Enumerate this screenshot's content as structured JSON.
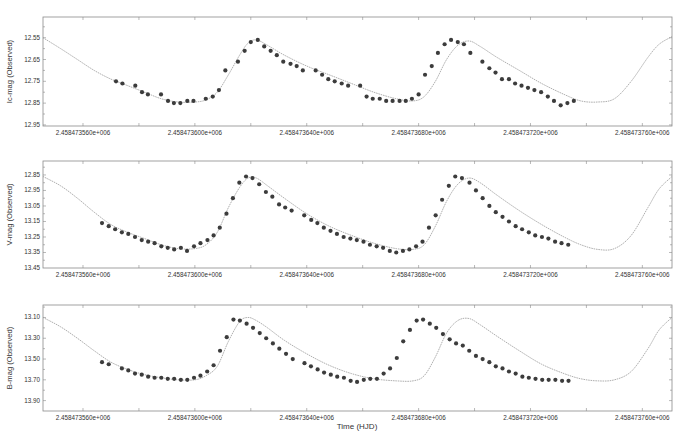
{
  "chart_data": [
    {
      "type": "scatter",
      "panel": "top",
      "ylabel": "Ic-mag (Observed)",
      "xlabel": "",
      "y_inverted": true,
      "yticks": [
        12.55,
        12.65,
        12.75,
        12.85,
        12.95
      ],
      "ytick_labels": [
        "12.55",
        "12.65",
        "12.75",
        "12.85",
        "12.95"
      ],
      "ylim": [
        12.955,
        12.455
      ],
      "xticks": [
        73560,
        73600,
        73640,
        73680,
        73720,
        73760
      ],
      "xtick_labels": [
        "2.458473560e+006",
        "2.458473600e+006",
        "2.458473640e+006",
        "2.458473680e+006",
        "2.458473720e+006",
        "2.458473760e+006"
      ],
      "xlim": [
        73545.7,
        73770.6
      ],
      "x_offset_note": "x values are HJD - 2458400",
      "series": [
        {
          "name": "observed",
          "style": "markers",
          "x": [
            73571.8,
            73574.1,
            73578.7,
            73581.1,
            73583.2,
            73587.9,
            73590.4,
            73592.5,
            73594.8,
            73597.3,
            73599.5,
            73603.9,
            73606.4,
            73608.6,
            73610.9,
            73615.4,
            73617.8,
            73620.0,
            73622.5,
            73624.8,
            73627.1,
            73629.3,
            73631.6,
            73634.2,
            73636.4,
            73638.6,
            73643.2,
            73645.5,
            73647.7,
            73650.0,
            73652.5,
            73654.8,
            73659.1,
            73661.4,
            73663.6,
            73666.1,
            73668.4,
            73670.7,
            73673.2,
            73675.4,
            73677.6,
            73680.0,
            73682.3,
            73684.7,
            73686.9,
            73689.3,
            73691.6,
            73694.0,
            73696.2,
            73698.5,
            73702.8,
            73705.3,
            73707.5,
            73709.8,
            73712.3,
            73714.5,
            73716.8,
            73719.1,
            73721.4,
            73723.8,
            73726.2,
            73728.4,
            73730.8,
            73733.2,
            73735.5
          ],
          "y": [
            12.75,
            12.76,
            12.77,
            12.8,
            12.81,
            12.81,
            12.84,
            12.85,
            12.85,
            12.84,
            12.84,
            12.83,
            12.82,
            12.79,
            12.7,
            12.66,
            12.61,
            12.57,
            12.56,
            12.59,
            12.61,
            12.63,
            12.66,
            12.67,
            12.68,
            12.7,
            12.7,
            12.72,
            12.74,
            12.75,
            12.76,
            12.77,
            12.77,
            12.82,
            12.83,
            12.83,
            12.84,
            12.84,
            12.84,
            12.84,
            12.83,
            12.81,
            12.72,
            12.68,
            12.62,
            12.58,
            12.56,
            12.57,
            12.58,
            12.62,
            12.66,
            12.69,
            12.71,
            12.74,
            12.74,
            12.76,
            12.77,
            12.78,
            12.79,
            12.8,
            12.82,
            12.84,
            12.86,
            12.85,
            12.84
          ]
        },
        {
          "name": "model fit",
          "style": "line",
          "color": "#9a9a9a",
          "x": [
            73545.7,
            73552,
            73558,
            73564,
            73570,
            73576,
            73582,
            73588,
            73594,
            73600,
            73604,
            73608,
            73612,
            73616,
            73619,
            73622,
            73626,
            73632,
            73640,
            73648,
            73656,
            73664,
            73672,
            73678,
            73682,
            73686,
            73690,
            73694,
            73698,
            73702,
            73708,
            73716,
            73724,
            73732,
            73738,
            73744,
            73750,
            73756,
            73762,
            73766,
            73770.6
          ],
          "y": [
            12.55,
            12.6,
            12.65,
            12.7,
            12.74,
            12.77,
            12.8,
            12.83,
            12.845,
            12.845,
            12.835,
            12.8,
            12.72,
            12.63,
            12.575,
            12.56,
            12.585,
            12.63,
            12.68,
            12.72,
            12.76,
            12.8,
            12.83,
            12.84,
            12.82,
            12.75,
            12.65,
            12.585,
            12.565,
            12.59,
            12.64,
            12.7,
            12.76,
            12.81,
            12.84,
            12.845,
            12.83,
            12.75,
            12.64,
            12.58,
            12.545
          ]
        }
      ]
    },
    {
      "type": "scatter",
      "panel": "middle",
      "ylabel": "V-mag (Observed)",
      "xlabel": "",
      "y_inverted": true,
      "yticks": [
        12.85,
        12.95,
        13.05,
        13.15,
        13.25,
        13.35,
        13.45
      ],
      "ytick_labels": [
        "12.85",
        "12.95",
        "13.05",
        "13.15",
        "13.25",
        "13.35",
        "13.45"
      ],
      "ylim": [
        13.45,
        12.76
      ],
      "xticks": [
        73560,
        73600,
        73640,
        73680,
        73720,
        73760
      ],
      "xtick_labels": [
        "2.458473560e+006",
        "2.458473600e+006",
        "2.458473640e+006",
        "2.458473680e+006",
        "2.458473720e+006",
        "2.458473760e+006"
      ],
      "xlim": [
        73545.7,
        73770.6
      ],
      "series": [
        {
          "name": "observed",
          "style": "markers",
          "x": [
            73566.8,
            73569.2,
            73571.5,
            73573.9,
            73576.2,
            73578.6,
            73581.0,
            73583.3,
            73585.6,
            73588.0,
            73590.3,
            73592.6,
            73595.0,
            73597.2,
            73599.7,
            73602.0,
            73604.5,
            73606.7,
            73608.9,
            73611.3,
            73613.6,
            73615.9,
            73618.3,
            73620.6,
            73623.0,
            73625.4,
            73627.7,
            73630.1,
            73632.3,
            73634.6,
            73639.1,
            73641.6,
            73643.8,
            73646.1,
            73648.5,
            73650.8,
            73653.2,
            73655.6,
            73657.9,
            73660.3,
            73662.6,
            73665.0,
            73667.3,
            73669.7,
            73672.0,
            73674.4,
            73676.7,
            73679.1,
            73681.4,
            73683.7,
            73686.1,
            73688.4,
            73690.8,
            73693.1,
            73695.5,
            73698.2,
            73700.5,
            73702.9,
            73705.3,
            73707.6,
            73710.0,
            73712.3,
            73714.7,
            73717.0,
            73719.4,
            73721.7,
            73724.1,
            73726.4,
            73728.8,
            73731.1,
            73733.5
          ],
          "y": [
            13.16,
            13.18,
            13.2,
            13.22,
            13.23,
            13.25,
            13.27,
            13.28,
            13.29,
            13.31,
            13.32,
            13.33,
            13.32,
            13.34,
            13.31,
            13.29,
            13.27,
            13.24,
            13.19,
            13.1,
            13.0,
            12.9,
            12.86,
            12.87,
            12.91,
            12.96,
            12.99,
            13.04,
            13.06,
            13.08,
            13.11,
            13.14,
            13.16,
            13.19,
            13.21,
            13.23,
            13.25,
            13.26,
            13.27,
            13.28,
            13.3,
            13.31,
            13.32,
            13.34,
            13.35,
            13.34,
            13.33,
            13.31,
            13.28,
            13.19,
            13.11,
            13.01,
            12.92,
            12.86,
            12.87,
            12.9,
            12.95,
            13.0,
            13.05,
            13.09,
            13.12,
            13.15,
            13.18,
            13.2,
            13.22,
            13.24,
            13.25,
            13.26,
            13.28,
            13.29,
            13.3
          ]
        },
        {
          "name": "model fit",
          "style": "line",
          "color": "#9a9a9a",
          "x": [
            73545.7,
            73552,
            73558,
            73564,
            73570,
            73576,
            73582,
            73588,
            73594,
            73600,
            73604,
            73608,
            73612,
            73616,
            73619,
            73622,
            73626,
            73632,
            73640,
            73648,
            73656,
            73664,
            73672,
            73678,
            73682,
            73686,
            73690,
            73694,
            73698,
            73702,
            73708,
            73716,
            73724,
            73732,
            73738,
            73744,
            73750,
            73756,
            73762,
            73766,
            73770.6
          ],
          "y": [
            12.86,
            12.92,
            13.0,
            13.09,
            13.17,
            13.22,
            13.26,
            13.3,
            13.325,
            13.325,
            13.3,
            13.22,
            13.06,
            12.93,
            12.87,
            12.87,
            12.92,
            13.0,
            13.1,
            13.18,
            13.24,
            13.29,
            13.325,
            13.33,
            13.3,
            13.18,
            13.02,
            12.91,
            12.87,
            12.9,
            12.98,
            13.08,
            13.17,
            13.25,
            13.3,
            13.33,
            13.325,
            13.24,
            13.06,
            12.94,
            12.86
          ]
        }
      ]
    },
    {
      "type": "scatter",
      "panel": "bottom",
      "ylabel": "B-mag (Observed)",
      "xlabel": "Time (HJD)",
      "y_inverted": true,
      "yticks": [
        13.1,
        13.3,
        13.5,
        13.7,
        13.9
      ],
      "ytick_labels": [
        "13.10",
        "13.30",
        "13.50",
        "13.70",
        "13.90"
      ],
      "ylim": [
        14.0,
        12.98
      ],
      "xticks": [
        73560,
        73600,
        73640,
        73680,
        73720,
        73760
      ],
      "xtick_labels": [
        "2.458473560e+006",
        "2.458473600e+006",
        "2.458473640e+006",
        "2.458473680e+006",
        "2.458473720e+006",
        "2.458473760e+006"
      ],
      "xlim": [
        73545.7,
        73770.6
      ],
      "series": [
        {
          "name": "observed",
          "style": "markers",
          "x": [
            73566.8,
            73569.2,
            73573.9,
            73576.2,
            73578.6,
            73581.0,
            73583.3,
            73585.6,
            73588.0,
            73590.3,
            73592.6,
            73595.0,
            73597.3,
            73599.7,
            73602.0,
            73604.4,
            73606.7,
            73609.0,
            73611.4,
            73613.8,
            73616.1,
            73618.5,
            73620.8,
            73623.2,
            73625.5,
            73627.9,
            73630.2,
            73632.6,
            73635.0,
            73639.2,
            73641.5,
            73643.9,
            73646.2,
            73648.6,
            73650.9,
            73653.3,
            73655.7,
            73658.0,
            73660.4,
            73662.7,
            73665.1,
            73667.5,
            73669.8,
            73672.2,
            73674.5,
            73676.9,
            73679.3,
            73681.6,
            73684.0,
            73686.3,
            73688.7,
            73691.1,
            73693.4,
            73695.8,
            73698.1,
            73700.5,
            73702.9,
            73705.3,
            73707.6,
            73710.0,
            73712.3,
            73714.7,
            73717.1,
            73719.4,
            73721.8,
            73724.2,
            73726.5,
            73728.9,
            73731.3,
            73733.6
          ],
          "y": [
            13.53,
            13.55,
            13.59,
            13.61,
            13.64,
            13.65,
            13.67,
            13.68,
            13.68,
            13.69,
            13.69,
            13.7,
            13.7,
            13.68,
            13.66,
            13.62,
            13.56,
            13.42,
            13.29,
            13.12,
            13.13,
            13.16,
            13.2,
            13.25,
            13.3,
            13.35,
            13.4,
            13.45,
            13.5,
            13.54,
            13.57,
            13.6,
            13.63,
            13.65,
            13.67,
            13.68,
            13.71,
            13.72,
            13.7,
            13.69,
            13.69,
            13.64,
            13.59,
            13.49,
            13.33,
            13.22,
            13.13,
            13.12,
            13.16,
            13.2,
            13.26,
            13.31,
            13.35,
            13.37,
            13.42,
            13.47,
            13.5,
            13.53,
            13.57,
            13.59,
            13.62,
            13.64,
            13.67,
            13.68,
            13.69,
            13.7,
            13.7,
            13.7,
            13.71,
            13.71
          ]
        },
        {
          "name": "model fit",
          "style": "line",
          "color": "#9a9a9a",
          "x": [
            73545.7,
            73552,
            73558,
            73564,
            73570,
            73576,
            73582,
            73588,
            73594,
            73600,
            73604,
            73608,
            73612,
            73616,
            73619,
            73622,
            73626,
            73632,
            73640,
            73648,
            73656,
            73664,
            73672,
            73678,
            73682,
            73686,
            73690,
            73694,
            73698,
            73702,
            73708,
            73716,
            73724,
            73732,
            73738,
            73744,
            73750,
            73756,
            73762,
            73766,
            73770.6
          ],
          "y": [
            13.1,
            13.19,
            13.3,
            13.42,
            13.53,
            13.6,
            13.65,
            13.68,
            13.7,
            13.7,
            13.66,
            13.57,
            13.33,
            13.14,
            13.1,
            13.13,
            13.2,
            13.32,
            13.45,
            13.56,
            13.64,
            13.69,
            13.71,
            13.71,
            13.66,
            13.48,
            13.25,
            13.13,
            13.11,
            13.17,
            13.28,
            13.42,
            13.55,
            13.64,
            13.69,
            13.71,
            13.7,
            13.62,
            13.4,
            13.22,
            13.1
          ]
        }
      ]
    }
  ],
  "figure": {
    "bottom_xlabel": "Time (HJD)",
    "panels": [
      {
        "ylabel": "Ic-mag (Observed)"
      },
      {
        "ylabel": "V-mag (Observed)"
      },
      {
        "ylabel": "B-mag (Observed)"
      }
    ],
    "colors": {
      "frame": "#8a8a8a",
      "marker": "#3c3c3c",
      "fit_line": "#9a9a9a",
      "text": "#333333"
    }
  }
}
